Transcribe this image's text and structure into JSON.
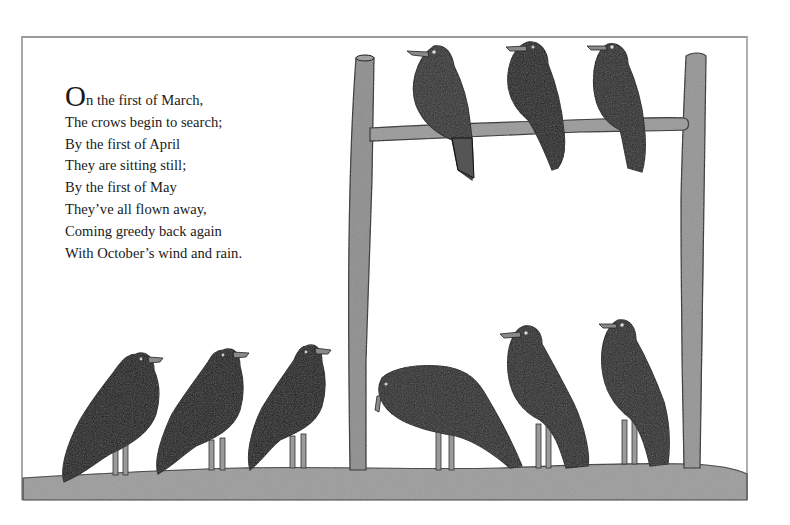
{
  "poem": {
    "drop_cap": "O",
    "first_line_rest": "n the first of March,",
    "lines": [
      "The crows begin to search;",
      "By the first of April",
      "They are sitting still;",
      "By the first of May",
      "They’ve all flown away,",
      "Coming greedy back again",
      "With October’s wind and rain."
    ]
  },
  "illustration": {
    "subject": "crows on a wooden perch and on the ground",
    "perched_crows": 3,
    "ground_crows": 6,
    "colors": {
      "crow_dark": "#1c1c1c",
      "crow_mid": "#2e2e2e",
      "wood": "#8f8f8f",
      "ground": "#999999",
      "beak": "#8a8a8a",
      "outline": "#1a1a1a"
    }
  }
}
